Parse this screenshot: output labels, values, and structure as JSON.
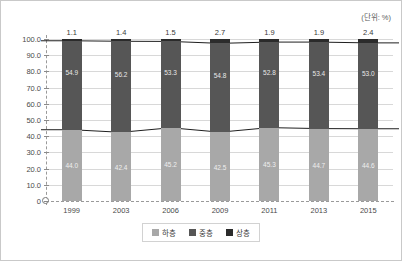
{
  "unit_label": "(단위: %)",
  "legend": {
    "items": [
      {
        "label": "하층",
        "color": "#a8a8a8"
      },
      {
        "label": "중층",
        "color": "#565656"
      },
      {
        "label": "상층",
        "color": "#2b2b2b"
      }
    ]
  },
  "y_axis": {
    "ticks": [
      "100.0",
      "90.0",
      "80.0",
      "70.0",
      "60.0",
      "50.0",
      "40.0",
      "30.0",
      "20.0",
      "10.0",
      "0"
    ],
    "min": 0,
    "max": 100,
    "step": 10
  },
  "chart_data": {
    "type": "bar",
    "title": "",
    "subtitle": "",
    "xlabel": "",
    "ylabel": "",
    "ylim": [
      0,
      100
    ],
    "grid": true,
    "stacked": true,
    "legend_position": "bottom",
    "annotations": [
      "(단위: %)"
    ],
    "categories": [
      "1999",
      "2003",
      "2006",
      "2009",
      "2011",
      "2013",
      "2015"
    ],
    "series": [
      {
        "name": "하층",
        "color": "#a8a8a8",
        "values": [
          44.0,
          42.4,
          45.2,
          42.5,
          45.3,
          44.7,
          44.6
        ]
      },
      {
        "name": "중층",
        "color": "#565656",
        "values": [
          54.9,
          56.2,
          53.3,
          54.8,
          52.8,
          53.4,
          53.0
        ]
      },
      {
        "name": "상층",
        "color": "#2b2b2b",
        "values": [
          1.1,
          1.4,
          1.5,
          2.7,
          1.9,
          1.9,
          2.4
        ]
      }
    ]
  }
}
